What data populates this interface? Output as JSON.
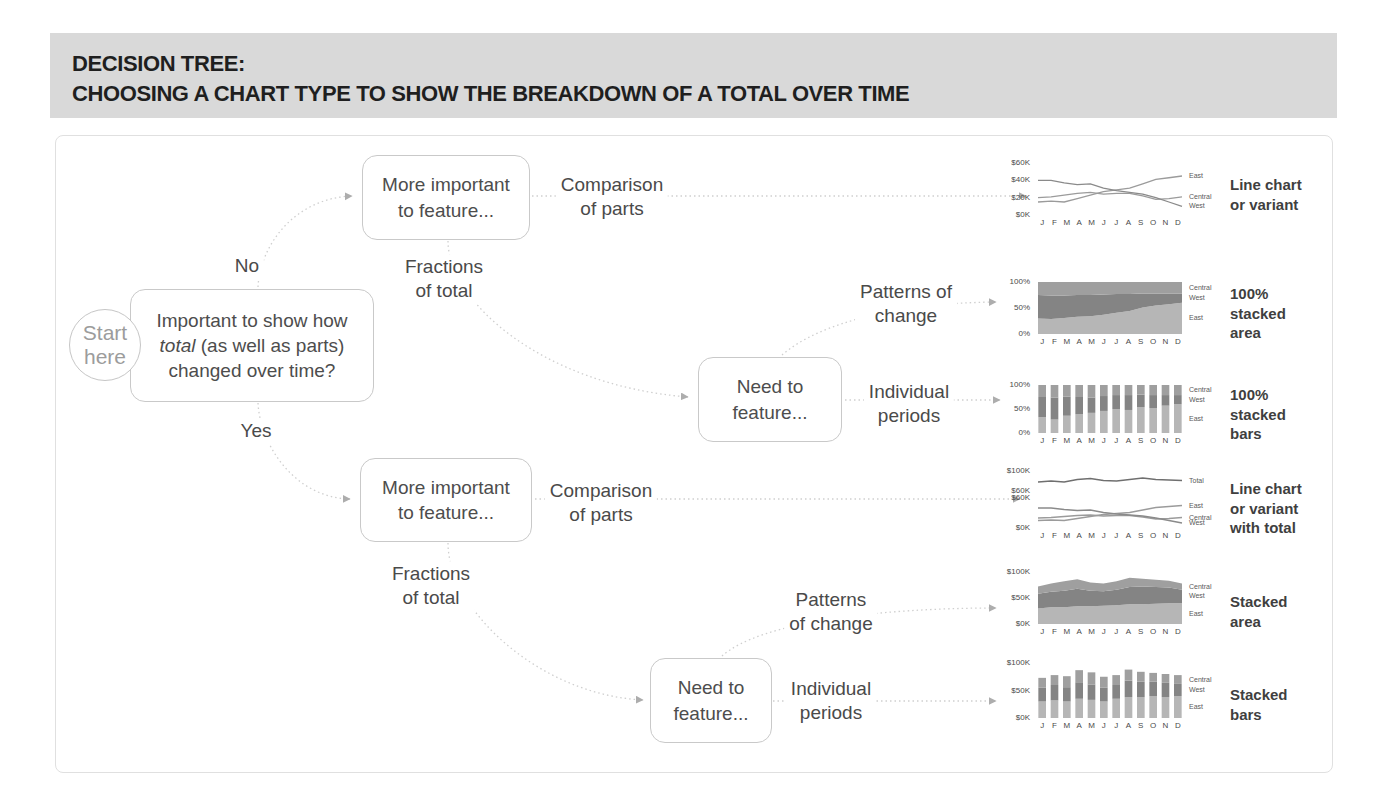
{
  "title": {
    "line1": "DECISION TREE:",
    "line2": "CHOOSING A CHART TYPE TO SHOW THE BREAKDOWN OF A TOTAL OVER TIME"
  },
  "nodes": {
    "start": "Start\nhere",
    "question": {
      "line1": "Important to show how",
      "italic": "total",
      "line2rest": " (as well as parts)",
      "line3": "changed over time?"
    },
    "more1": "More important\nto feature...",
    "more2": "More important\nto feature...",
    "need1": "Need to\nfeature...",
    "need2": "Need to\nfeature..."
  },
  "edge_labels": {
    "no": "No",
    "yes": "Yes",
    "comparison1": "Comparison\nof parts",
    "fractions1": "Fractions\nof total",
    "patterns1": "Patterns of\nchange",
    "individual1": "Individual\nperiods",
    "comparison2": "Comparison\nof parts",
    "fractions2": "Fractions\nof total",
    "patterns2": "Patterns\nof change",
    "individual2": "Individual\nperiods"
  },
  "chart_data": [
    {
      "name": "line-chart",
      "type_label": "Line chart\nor variant",
      "type": "line",
      "x": [
        "J",
        "F",
        "M",
        "A",
        "M",
        "J",
        "J",
        "A",
        "S",
        "O",
        "N",
        "D"
      ],
      "ylim": [
        0,
        60
      ],
      "yticks": [
        {
          "v": 60,
          "label": "$60K"
        },
        {
          "v": 40,
          "label": "$40K"
        },
        {
          "v": 20,
          "label": "$20K"
        },
        {
          "v": 0,
          "label": "$0K"
        }
      ],
      "series": [
        {
          "name": "East",
          "color": "#9b9b9b",
          "values": [
            15,
            16,
            15,
            19,
            23,
            27,
            29,
            31,
            36,
            41,
            43,
            45
          ]
        },
        {
          "name": "Central",
          "color": "#9b9b9b",
          "values": [
            20,
            21,
            23,
            25,
            26,
            24,
            25,
            25,
            22,
            18,
            19,
            21
          ]
        },
        {
          "name": "West",
          "color": "#8a8a8a",
          "values": [
            40,
            40,
            37,
            35,
            36,
            31,
            28,
            26,
            24,
            20,
            15,
            10
          ]
        }
      ]
    },
    {
      "name": "100-percent-stacked-area",
      "type_label": "100%\nstacked\narea",
      "type": "area",
      "x": [
        "J",
        "F",
        "M",
        "A",
        "M",
        "J",
        "J",
        "A",
        "S",
        "O",
        "N",
        "D"
      ],
      "ylim": [
        0,
        100
      ],
      "yticks": [
        {
          "v": 100,
          "label": "100%"
        },
        {
          "v": 50,
          "label": "50%"
        },
        {
          "v": 0,
          "label": "0%"
        }
      ],
      "series": [
        {
          "name": "East",
          "color": "#b6b6b6",
          "values": [
            30,
            29,
            31,
            33,
            34,
            37,
            41,
            44,
            51,
            55,
            57,
            60
          ]
        },
        {
          "name": "West",
          "color": "#848484",
          "values": [
            45,
            45,
            43,
            42,
            41,
            39,
            36,
            33,
            27,
            23,
            21,
            18
          ]
        },
        {
          "name": "Central",
          "color": "#9f9f9f",
          "values": [
            25,
            26,
            26,
            25,
            25,
            24,
            23,
            23,
            22,
            22,
            22,
            22
          ]
        }
      ]
    },
    {
      "name": "100-percent-stacked-bars",
      "type_label": "100%\nstacked\nbars",
      "type": "bar",
      "x": [
        "J",
        "F",
        "M",
        "A",
        "M",
        "J",
        "J",
        "A",
        "S",
        "O",
        "N",
        "D"
      ],
      "ylim": [
        0,
        100
      ],
      "yticks": [
        {
          "v": 100,
          "label": "100%"
        },
        {
          "v": 50,
          "label": "50%"
        },
        {
          "v": 0,
          "label": "0%"
        }
      ],
      "series": [
        {
          "name": "East",
          "color": "#b6b6b6",
          "values": [
            33,
            28,
            36,
            39,
            42,
            46,
            50,
            48,
            54,
            52,
            57,
            60
          ]
        },
        {
          "name": "West",
          "color": "#848484",
          "values": [
            42,
            46,
            40,
            36,
            32,
            31,
            29,
            31,
            26,
            27,
            22,
            19
          ]
        },
        {
          "name": "Central",
          "color": "#9f9f9f",
          "values": [
            25,
            26,
            24,
            25,
            26,
            23,
            21,
            21,
            20,
            21,
            21,
            21
          ]
        }
      ]
    },
    {
      "name": "line-chart-with-total",
      "type_label": "Line chart\nor variant\nwith total",
      "type": "line_total",
      "x": [
        "J",
        "F",
        "M",
        "A",
        "M",
        "J",
        "J",
        "A",
        "S",
        "O",
        "N",
        "D"
      ],
      "panels": [
        {
          "type": "line",
          "ylim": [
            60,
            100
          ],
          "yticks": [
            {
              "v": 100,
              "label": "$100K"
            },
            {
              "v": 60,
              "label": "$60K"
            }
          ],
          "series": [
            {
              "name": "Total",
              "color": "#6f6f6f",
              "values": [
                78,
                80,
                78,
                83,
                85,
                81,
                80,
                83,
                86,
                83,
                82,
                81
              ]
            }
          ]
        },
        {
          "type": "line",
          "ylim": [
            0,
            60
          ],
          "yticks": [
            {
              "v": 60,
              "label": "$60K"
            },
            {
              "v": 0,
              "label": "$0K"
            }
          ],
          "series": [
            {
              "name": "East",
              "color": "#9b9b9b",
              "values": [
                15,
                16,
                15,
                19,
                23,
                27,
                29,
                31,
                36,
                41,
                43,
                45
              ]
            },
            {
              "name": "Central",
              "color": "#9b9b9b",
              "values": [
                20,
                21,
                23,
                25,
                26,
                24,
                25,
                25,
                22,
                18,
                19,
                21
              ]
            },
            {
              "name": "West",
              "color": "#8a8a8a",
              "values": [
                40,
                40,
                37,
                35,
                36,
                31,
                28,
                26,
                24,
                20,
                15,
                10
              ]
            }
          ]
        }
      ]
    },
    {
      "name": "stacked-area",
      "type_label": "Stacked\narea",
      "type": "area",
      "x": [
        "J",
        "F",
        "M",
        "A",
        "M",
        "J",
        "J",
        "A",
        "S",
        "O",
        "N",
        "D"
      ],
      "ylim": [
        0,
        100
      ],
      "yticks": [
        {
          "v": 100,
          "label": "$100K"
        },
        {
          "v": 50,
          "label": "$50K"
        },
        {
          "v": 0,
          "label": "$0K"
        }
      ],
      "series": [
        {
          "name": "East",
          "color": "#b6b6b6",
          "values": [
            30,
            32,
            32,
            34,
            34,
            35,
            36,
            38,
            38,
            39,
            40,
            40
          ]
        },
        {
          "name": "West",
          "color": "#848484",
          "values": [
            28,
            30,
            32,
            34,
            30,
            28,
            30,
            33,
            34,
            32,
            30,
            26
          ]
        },
        {
          "name": "Central",
          "color": "#9f9f9f",
          "values": [
            14,
            16,
            18,
            18,
            16,
            15,
            16,
            18,
            15,
            14,
            13,
            12
          ]
        }
      ]
    },
    {
      "name": "stacked-bars",
      "type_label": "Stacked\nbars",
      "type": "bar",
      "x": [
        "J",
        "F",
        "M",
        "A",
        "M",
        "J",
        "J",
        "A",
        "S",
        "O",
        "N",
        "D"
      ],
      "ylim": [
        0,
        100
      ],
      "yticks": [
        {
          "v": 100,
          "label": "$100K"
        },
        {
          "v": 50,
          "label": "$50K"
        },
        {
          "v": 0,
          "label": "$0K"
        }
      ],
      "series": [
        {
          "name": "East",
          "color": "#b6b6b6",
          "values": [
            30,
            32,
            30,
            35,
            33,
            30,
            35,
            38,
            38,
            40,
            38,
            40
          ]
        },
        {
          "name": "West",
          "color": "#848484",
          "values": [
            25,
            28,
            26,
            30,
            28,
            25,
            25,
            30,
            28,
            26,
            26,
            22
          ]
        },
        {
          "name": "Central",
          "color": "#9f9f9f",
          "values": [
            18,
            18,
            20,
            22,
            22,
            20,
            18,
            20,
            18,
            16,
            16,
            16
          ]
        }
      ]
    }
  ]
}
